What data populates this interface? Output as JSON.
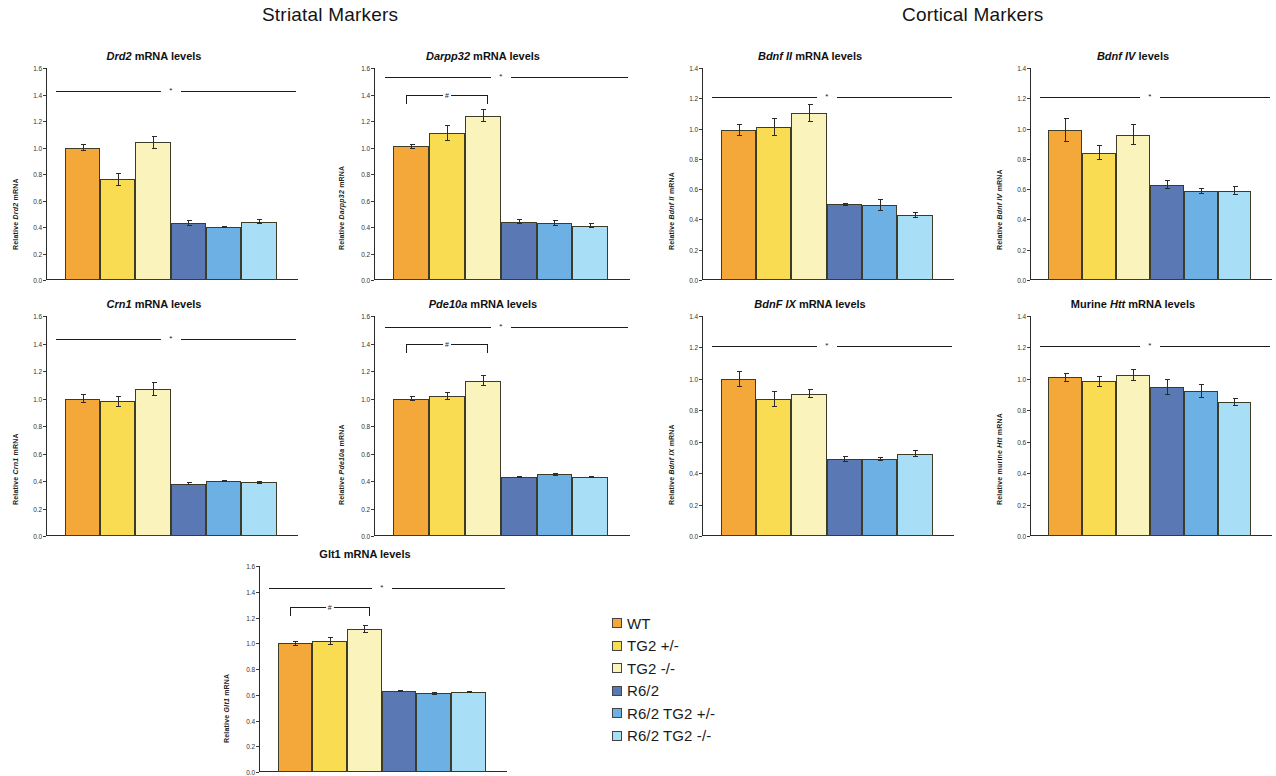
{
  "sections": [
    {
      "id": "striatal",
      "title": "Striatal Markers"
    },
    {
      "id": "cortical",
      "title": "Cortical Markers"
    }
  ],
  "legend": {
    "items": [
      {
        "label": "WT",
        "color": "#F4A83A"
      },
      {
        "label": "TG2 +/-",
        "color": "#FADC53"
      },
      {
        "label": "TG2 -/-",
        "color": "#FAF3BC"
      },
      {
        "label": "R6/2",
        "color": "#5A79B4"
      },
      {
        "label": "R6/2 TG2 +/-",
        "color": "#6DB1E4"
      },
      {
        "label": "R6/2 TG2 -/-",
        "color": "#A9DEF7"
      }
    ]
  },
  "chart_data": [
    {
      "id": "drd2",
      "type": "bar",
      "section": "striatal",
      "title": "Drd2 mRNA levels",
      "title_italic": "Drd2",
      "title_rest": " mRNA levels",
      "ylabel": "Relative Drd2 mRNA",
      "ylabel_italic": "Drd2",
      "xlabel": "",
      "ylim": [
        0,
        1.6
      ],
      "yticks": [
        "0.0",
        "0.2",
        "0.4",
        "0.6",
        "0.8",
        "1.0",
        "1.2",
        "1.4",
        "1.6"
      ],
      "grid": false,
      "categories": [
        "WT",
        "TG2 +/-",
        "TG2 -/-",
        "R6/2",
        "R6/2 TG2 +/-",
        "R6/2 TG2 -/-"
      ],
      "values": [
        1.0,
        0.76,
        1.04,
        0.43,
        0.4,
        0.44
      ],
      "errors": [
        0.03,
        0.05,
        0.05,
        0.02,
        0.01,
        0.02
      ],
      "annotations": [
        {
          "kind": "sig-split-line",
          "y": 1.43,
          "symbol": "*"
        }
      ]
    },
    {
      "id": "darpp32",
      "type": "bar",
      "section": "striatal",
      "title": "Darpp32 mRNA levels",
      "title_italic": "Darpp32",
      "title_rest": " mRNA levels",
      "ylabel": "Relative Darpp32 mRNA",
      "ylabel_italic": "Darpp32",
      "xlabel": "",
      "ylim": [
        0,
        1.6
      ],
      "yticks": [
        "0.0",
        "0.2",
        "0.4",
        "0.6",
        "0.8",
        "1.0",
        "1.2",
        "1.4",
        "1.6"
      ],
      "grid": false,
      "categories": [
        "WT",
        "TG2 +/-",
        "TG2 -/-",
        "R6/2",
        "R6/2 TG2 +/-",
        "R6/2 TG2 -/-"
      ],
      "values": [
        1.01,
        1.11,
        1.24,
        0.44,
        0.43,
        0.41
      ],
      "errors": [
        0.02,
        0.06,
        0.05,
        0.02,
        0.02,
        0.02
      ],
      "annotations": [
        {
          "kind": "sig-split-line",
          "y": 1.53,
          "symbol": "*"
        },
        {
          "kind": "bracket",
          "y": 1.4,
          "from": 0,
          "to": 2,
          "symbol": "#"
        }
      ]
    },
    {
      "id": "crn1",
      "type": "bar",
      "section": "striatal",
      "title": "Crn1 mRNA levels",
      "title_italic": "Crn1",
      "title_rest": " mRNA levels",
      "ylabel": "Relative Crn1 mRNA",
      "ylabel_italic": "Crn1",
      "xlabel": "",
      "ylim": [
        0,
        1.6
      ],
      "yticks": [
        "0.0",
        "0.2",
        "0.4",
        "0.6",
        "0.8",
        "1.0",
        "1.2",
        "1.4",
        "1.6"
      ],
      "grid": false,
      "categories": [
        "WT",
        "TG2 +/-",
        "TG2 -/-",
        "R6/2",
        "R6/2 TG2 +/-",
        "R6/2 TG2 -/-"
      ],
      "values": [
        1.0,
        0.98,
        1.07,
        0.38,
        0.4,
        0.39
      ],
      "errors": [
        0.03,
        0.04,
        0.05,
        0.01,
        0.01,
        0.01
      ],
      "annotations": [
        {
          "kind": "sig-split-line",
          "y": 1.43,
          "symbol": "*"
        }
      ]
    },
    {
      "id": "pde10a",
      "type": "bar",
      "section": "striatal",
      "title": "Pde10a mRNA levels",
      "title_italic": "Pde10a",
      "title_rest": " mRNA levels",
      "ylabel": "Relative Pde10a mRNA",
      "ylabel_italic": "Pde10a",
      "xlabel": "",
      "ylim": [
        0,
        1.6
      ],
      "yticks": [
        "0.0",
        "0.2",
        "0.4",
        "0.6",
        "0.8",
        "1.0",
        "1.2",
        "1.4",
        "1.6"
      ],
      "grid": false,
      "categories": [
        "WT",
        "TG2 +/-",
        "TG2 -/-",
        "R6/2",
        "R6/2 TG2 +/-",
        "R6/2 TG2 -/-"
      ],
      "values": [
        1.0,
        1.02,
        1.13,
        0.43,
        0.45,
        0.43
      ],
      "errors": [
        0.02,
        0.03,
        0.04,
        0.01,
        0.01,
        0.01
      ],
      "annotations": [
        {
          "kind": "sig-split-line",
          "y": 1.52,
          "symbol": "*"
        },
        {
          "kind": "bracket",
          "y": 1.4,
          "from": 0,
          "to": 2,
          "symbol": "#"
        }
      ]
    },
    {
      "id": "glt1",
      "type": "bar",
      "section": "striatal",
      "title": "Glt1 mRNA levels",
      "title_italic": "",
      "title_rest": "Glt1 mRNA levels",
      "ylabel": "Relative Glt1 mRNA",
      "ylabel_italic": "Glt1",
      "xlabel": "",
      "ylim": [
        0,
        1.6
      ],
      "yticks": [
        "0.0",
        "0.2",
        "0.4",
        "0.6",
        "0.8",
        "1.0",
        "1.2",
        "1.4",
        "1.6"
      ],
      "grid": false,
      "categories": [
        "WT",
        "TG2 +/-",
        "TG2 -/-",
        "R6/2",
        "R6/2 TG2 +/-",
        "R6/2 TG2 -/-"
      ],
      "values": [
        1.0,
        1.02,
        1.11,
        0.63,
        0.61,
        0.62
      ],
      "errors": [
        0.02,
        0.03,
        0.03,
        0.01,
        0.01,
        0.01
      ],
      "annotations": [
        {
          "kind": "sig-split-line",
          "y": 1.43,
          "symbol": "*"
        },
        {
          "kind": "bracket",
          "y": 1.28,
          "from": 0,
          "to": 2,
          "symbol": "#"
        }
      ]
    },
    {
      "id": "bdnf2",
      "type": "bar",
      "section": "cortical",
      "title": "Bdnf II mRNA levels",
      "title_italic": "Bdnf II",
      "title_rest": " mRNA levels",
      "ylabel": "Relative Bdnf II mRNA",
      "ylabel_italic": "Bdnf II",
      "xlabel": "",
      "ylim": [
        0,
        1.4
      ],
      "yticks": [
        "0.0",
        "0.2",
        "0.4",
        "0.6",
        "0.8",
        "1.0",
        "1.2",
        "1.4"
      ],
      "grid": false,
      "categories": [
        "WT",
        "TG2 +/-",
        "TG2 -/-",
        "R6/2",
        "R6/2 TG2 +/-",
        "R6/2 TG2 -/-"
      ],
      "values": [
        0.99,
        1.01,
        1.1,
        0.5,
        0.495,
        0.43
      ],
      "errors": [
        0.04,
        0.06,
        0.06,
        0.01,
        0.04,
        0.02
      ],
      "annotations": [
        {
          "kind": "sig-split-line",
          "y": 1.21,
          "symbol": "*"
        }
      ]
    },
    {
      "id": "bdnf4",
      "type": "bar",
      "section": "cortical",
      "title": "Bdnf IV levels",
      "title_italic": "Bdnf IV",
      "title_rest": " levels",
      "ylabel": "Relative Bdnf IV mRNA",
      "ylabel_italic": "Bdnf IV",
      "xlabel": "",
      "ylim": [
        0,
        1.4
      ],
      "yticks": [
        "0.0",
        "0.2",
        "0.4",
        "0.6",
        "0.8",
        "1.0",
        "1.2",
        "1.4"
      ],
      "grid": false,
      "categories": [
        "WT",
        "TG2 +/-",
        "TG2 -/-",
        "R6/2",
        "R6/2 TG2 +/-",
        "R6/2 TG2 -/-"
      ],
      "values": [
        0.99,
        0.84,
        0.96,
        0.63,
        0.585,
        0.59
      ],
      "errors": [
        0.08,
        0.05,
        0.07,
        0.03,
        0.02,
        0.03
      ],
      "annotations": [
        {
          "kind": "sig-split-line",
          "y": 1.21,
          "symbol": "*"
        }
      ]
    },
    {
      "id": "bdnf9",
      "type": "bar",
      "section": "cortical",
      "title": "BdnF IX mRNA levels",
      "title_italic": "BdnF IX",
      "title_rest": " mRNA levels",
      "ylabel": "Relative Bdnf IX mRNA",
      "ylabel_italic": "Bdnf IX",
      "xlabel": "",
      "ylim": [
        0,
        1.4
      ],
      "yticks": [
        "0.0",
        "0.2",
        "0.4",
        "0.6",
        "0.8",
        "1.0",
        "1.2",
        "1.4"
      ],
      "grid": false,
      "categories": [
        "WT",
        "TG2 +/-",
        "TG2 -/-",
        "R6/2",
        "R6/2 TG2 +/-",
        "R6/2 TG2 -/-"
      ],
      "values": [
        1.0,
        0.87,
        0.905,
        0.49,
        0.49,
        0.525
      ],
      "errors": [
        0.05,
        0.05,
        0.03,
        0.02,
        0.01,
        0.02
      ],
      "annotations": [
        {
          "kind": "sig-split-line",
          "y": 1.21,
          "symbol": "*"
        }
      ]
    },
    {
      "id": "htt",
      "type": "bar",
      "section": "cortical",
      "title": "Murine Htt mRNA levels",
      "title_italic": "Htt",
      "title_prefix": "Murine ",
      "title_rest": " mRNA levels",
      "ylabel": "Relative murine Htt mRNA",
      "ylabel_italic": "Htt",
      "xlabel": "",
      "ylim": [
        0,
        1.4
      ],
      "yticks": [
        "0.0",
        "0.2",
        "0.4",
        "0.6",
        "0.8",
        "1.0",
        "1.2",
        "1.4"
      ],
      "grid": false,
      "categories": [
        "WT",
        "TG2 +/-",
        "TG2 -/-",
        "R6/2",
        "R6/2 TG2 +/-",
        "R6/2 TG2 -/-"
      ],
      "values": [
        1.01,
        0.985,
        1.025,
        0.95,
        0.925,
        0.855
      ],
      "errors": [
        0.03,
        0.035,
        0.04,
        0.05,
        0.045,
        0.025
      ],
      "annotations": [
        {
          "kind": "sig-split-line",
          "y": 1.21,
          "symbol": "*"
        }
      ]
    }
  ]
}
